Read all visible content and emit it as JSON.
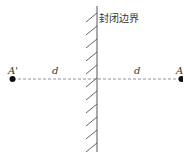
{
  "diagram": {
    "boundary_label": "封闭边界",
    "point_left_label": "A'",
    "point_right_label": "A",
    "distance_left_label": "d",
    "distance_right_label": "d",
    "colors": {
      "line": "#555555",
      "dash": "#777777",
      "point": "#111111"
    }
  }
}
